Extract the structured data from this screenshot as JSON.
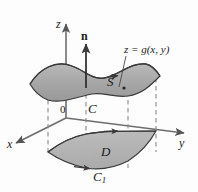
{
  "figure": {
    "kind": "3d-surface-diagram",
    "caption_labels": {
      "z_axis": "z",
      "x_axis": "x",
      "y_axis": "y",
      "origin": "0",
      "normal_vector": "n",
      "surface": "S",
      "surface_equation": "z = g(x, y)",
      "boundary_curve_upper": "C",
      "region": "D",
      "boundary_curve_lower_base": "C",
      "boundary_curve_lower_sub": "1"
    },
    "colors": {
      "surface_fill": "#a9a9a9",
      "surface_fill_light": "#c9c9c9",
      "region_fill": "#b4b4b4",
      "stroke": "#3a3a3a",
      "axis": "#6e6e6e",
      "dashed": "#8a8a8a",
      "background": "#fdfdfd",
      "text": "#1a1a1a"
    },
    "geometry_notes": {
      "surface_description": "wavy saddle sheet above xy-plane",
      "region_description": "shaded quadrilateral patch in xy-plane",
      "dashed_lines": 4,
      "orientation_arrows": 3
    }
  }
}
